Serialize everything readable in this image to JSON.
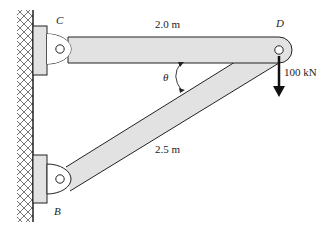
{
  "diagram": {
    "type": "truss-structure",
    "labels": {
      "point_c": "C",
      "point_d": "D",
      "point_b": "B",
      "length_cd": "2.0 m",
      "length_bd": "2.5 m",
      "angle": "θ",
      "load": "100 kN"
    },
    "members": [
      {
        "name": "CD",
        "length": "2.0 m",
        "orientation": "horizontal"
      },
      {
        "name": "BD",
        "length": "2.5 m",
        "orientation": "diagonal"
      }
    ],
    "supports": [
      "C",
      "B"
    ],
    "load": {
      "point": "D",
      "magnitude": "100 kN",
      "direction": "down"
    },
    "colors": {
      "member_fill": "#e2e2e2",
      "bracket_fill": "#e2e2e2",
      "stroke": "#222222",
      "background": "#ffffff"
    }
  }
}
